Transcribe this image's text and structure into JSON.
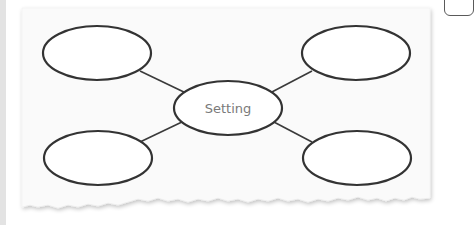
{
  "diagram": {
    "type": "graphic-organizer",
    "center_node": {
      "label": "Setting"
    },
    "outer_nodes": [
      {
        "position": "top-left",
        "label": ""
      },
      {
        "position": "top-right",
        "label": ""
      },
      {
        "position": "bottom-left",
        "label": ""
      },
      {
        "position": "bottom-right",
        "label": ""
      }
    ],
    "colors": {
      "stroke": "#333333",
      "paper": "#fafafa",
      "label": "#7a7a7a"
    }
  }
}
